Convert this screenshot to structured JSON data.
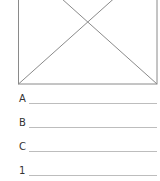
{
  "figure": {
    "type": "placeholder-box-with-diagonals",
    "stroke_color": "#8a8a8a"
  },
  "rows": [
    {
      "label": "A",
      "value": ""
    },
    {
      "label": "B",
      "value": ""
    },
    {
      "label": "C",
      "value": ""
    },
    {
      "label": "1",
      "value": ""
    }
  ]
}
